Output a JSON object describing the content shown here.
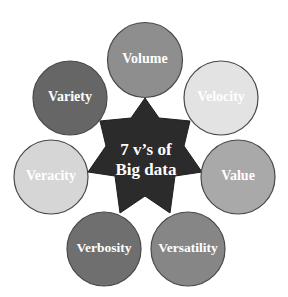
{
  "diagram": {
    "center": {
      "line1": "7 v’s of",
      "line2": "Big data",
      "color": "#2b2b2b"
    },
    "nodes": [
      {
        "label": "Volume",
        "color": "#8e8e8e"
      },
      {
        "label": "Velocity",
        "color": "#e3e3e3"
      },
      {
        "label": "Value",
        "color": "#a9a9a9"
      },
      {
        "label": "Versatility",
        "color": "#868686"
      },
      {
        "label": "Verbosity",
        "color": "#6f6f6f"
      },
      {
        "label": "Veracity",
        "color": "#d6d6d6"
      },
      {
        "label": "Variety",
        "color": "#666666"
      }
    ],
    "outline_color": "#4a4a4a"
  }
}
